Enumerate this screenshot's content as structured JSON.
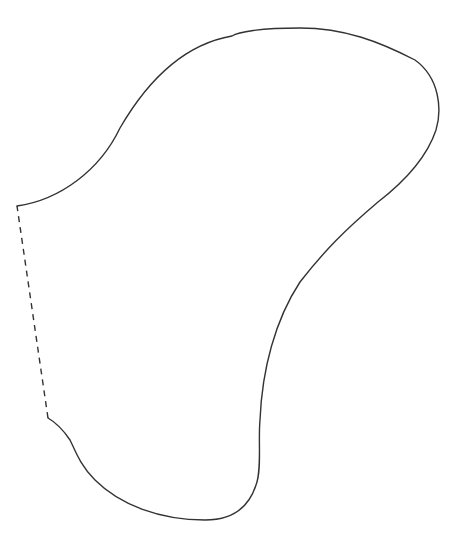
{
  "figure": {
    "description": "Freeform closed outline with one dashed edge",
    "stroke_color": "#333333",
    "background": "#ffffff",
    "solid_outline_path": "M 17 206 C 60 200, 100 170, 120 128 C 145 85, 180 45, 232 36 C 238 32, 260 28, 300 28 C 345 28, 380 42, 415 60 C 440 78, 442 110, 436 130 C 426 160, 400 185, 378 202 C 345 230, 325 250, 300 282 C 275 320, 262 370, 260 420 C 258 440, 262 470, 256 485 C 248 510, 230 520, 205 520 C 160 520, 120 505, 95 480 C 80 465, 75 450, 70 440 C 62 428, 55 422, 48 418",
    "dashed_edge": {
      "x1": 48,
      "y1": 418,
      "x2": 17,
      "y2": 206
    },
    "dash_pattern": "6,5",
    "stroke_width": 1.4
  }
}
